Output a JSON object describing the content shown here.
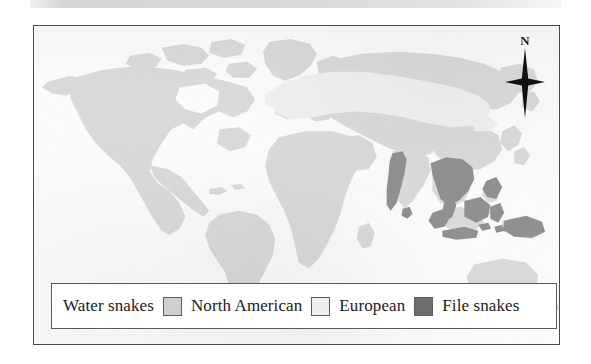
{
  "figure": {
    "type": "distribution-map",
    "kind": "world-map",
    "background_color": "#fbfbfb",
    "frame_color": "#4a4a4a"
  },
  "map": {
    "land_color": "#cfcfcf",
    "ocean_color": "#fbfbfb",
    "regions": [
      {
        "id": "north-american-water-snakes",
        "label": "North American",
        "color": "#cfcfcf"
      },
      {
        "id": "european-water-snakes",
        "label": "European",
        "color": "#ececec"
      },
      {
        "id": "file-snakes",
        "label": "File snakes",
        "color": "#6d6d6d"
      }
    ]
  },
  "compass": {
    "north_label": "N",
    "icon": "compass-star-icon",
    "color": "#101010"
  },
  "legend": {
    "title": "Water snakes",
    "border_color": "#5a5a5a",
    "items": [
      {
        "label": "North American",
        "color": "#cfcfcf"
      },
      {
        "label": "European",
        "color": "#efefef"
      },
      {
        "label": "File snakes",
        "color": "#6d6d6d"
      }
    ]
  }
}
